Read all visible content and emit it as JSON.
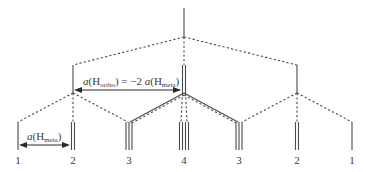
{
  "diagram": {
    "peak_labels": [
      "1",
      "2",
      "3",
      "4",
      "3",
      "2",
      "1"
    ],
    "peak_multiplicity": [
      1,
      2,
      3,
      4,
      3,
      2,
      1
    ],
    "annotation_ortho": {
      "prefix": "a",
      "open": "(H",
      "sub": "ortho",
      "middle": ") = −2 ",
      "prefix2": "a",
      "open2": "(H",
      "sub2": "meta",
      "close": ")"
    },
    "annotation_meta": {
      "prefix": "a",
      "open": "(H",
      "sub": "meta",
      "close": ")"
    }
  }
}
